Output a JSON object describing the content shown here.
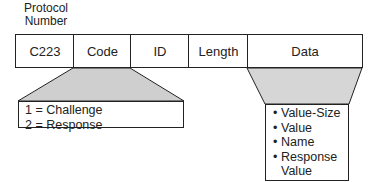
{
  "header_label": {
    "line1": "Protocol",
    "line2": "Number"
  },
  "fields": [
    {
      "label": "C223"
    },
    {
      "label": "Code"
    },
    {
      "label": "ID"
    },
    {
      "label": "Length"
    },
    {
      "label": "Data"
    }
  ],
  "code_values": [
    "1 = Challenge",
    "2 = Response"
  ],
  "data_items": [
    "Value-Size",
    "Value",
    "Name",
    "Response Value"
  ],
  "data_items_split": {
    "last_line1": "Response",
    "last_line2": "Value"
  },
  "colors": {
    "trapezoid_fill": "#cfcfcf",
    "stroke": "#222222"
  }
}
